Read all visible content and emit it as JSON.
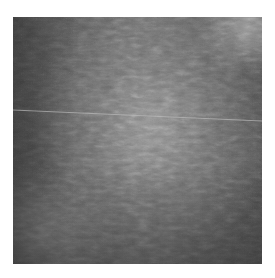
{
  "image": {
    "description": "Grayscale textured microscopy-style photograph with a lighter central oval region and a thin light horizontal line",
    "colors": {
      "background": "#ffffff",
      "dark_tone": "#474747",
      "mid_tone": "#6a6a6a",
      "light_tone": "#969696",
      "line": "#bdbdbd"
    },
    "line": {
      "x1": 0,
      "y1": 93,
      "x2": 249,
      "y2": 104
    }
  }
}
